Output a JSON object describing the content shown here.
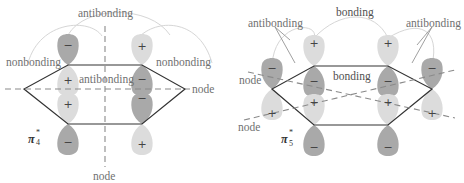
{
  "figure": {
    "top_cropped_text": "...g  ...p ... y  ... g",
    "colors": {
      "lobe_dark": "#a9a9a9",
      "lobe_light": "#dcdcdc",
      "hexagon": "#333333",
      "node_line": "#8a8a8a",
      "arc": "#d0d0d0",
      "label": "#707070"
    }
  },
  "left_panel": {
    "orbital_label": "π",
    "orbital_sup": "*",
    "orbital_sub": "4",
    "labels": {
      "top": "antibonding",
      "left": "nonbonding",
      "right": "nonbonding",
      "center": "antibonding",
      "node_horizontal": "node",
      "node_vertical": "node"
    },
    "lobes": [
      {
        "position": "top-left-upper",
        "sign": "−",
        "shade": "dark"
      },
      {
        "position": "top-right-upper",
        "sign": "+",
        "shade": "light"
      },
      {
        "position": "top-left-lower",
        "sign": "+",
        "shade": "light"
      },
      {
        "position": "top-right-lower",
        "sign": "−",
        "shade": "dark"
      },
      {
        "position": "mid-left-upper",
        "sign": "+",
        "shade": "light"
      },
      {
        "position": "mid-right-upper",
        "sign": "−",
        "shade": "dark"
      },
      {
        "position": "bottom-left-lower",
        "sign": "−",
        "shade": "dark"
      },
      {
        "position": "bottom-right-lower",
        "sign": "+",
        "shade": "light"
      }
    ]
  },
  "right_panel": {
    "orbital_label": "π",
    "orbital_sup": "*",
    "orbital_sub": "5",
    "labels": {
      "top": "bonding",
      "left": "antibonding",
      "right": "antibonding",
      "center": "bonding",
      "node": "node"
    },
    "lobes": [
      {
        "position": "top-left-upper",
        "sign": "+",
        "shade": "light"
      },
      {
        "position": "top-right-upper",
        "sign": "+",
        "shade": "light"
      },
      {
        "position": "far-left-upper",
        "sign": "−",
        "shade": "dark"
      },
      {
        "position": "far-right-upper",
        "sign": "−",
        "shade": "dark"
      },
      {
        "position": "top-left-lower",
        "sign": "−",
        "shade": "dark"
      },
      {
        "position": "top-right-lower",
        "sign": "−",
        "shade": "dark"
      },
      {
        "position": "mid-left",
        "sign": "+",
        "shade": "light"
      },
      {
        "position": "mid-right",
        "sign": "+",
        "shade": "light"
      },
      {
        "position": "far-left-lower",
        "sign": "+",
        "shade": "light"
      },
      {
        "position": "far-right-lower",
        "sign": "+",
        "shade": "light"
      },
      {
        "position": "bottom-left-lower",
        "sign": "−",
        "shade": "dark"
      },
      {
        "position": "bottom-right-lower",
        "sign": "−",
        "shade": "dark"
      }
    ]
  }
}
